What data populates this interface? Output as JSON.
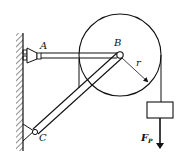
{
  "diagram": {
    "type": "statics-frame-with-pulley",
    "labels": {
      "support_a": "A",
      "pin_b": "B",
      "support_c": "C",
      "radius": "r",
      "force_main": "F",
      "force_sub": "P"
    },
    "components": [
      {
        "id": "wall",
        "description": "fixed vertical wall with hatching"
      },
      {
        "id": "bar-ab",
        "description": "horizontal bar from pin A to pin B"
      },
      {
        "id": "bar-cb",
        "description": "inclined bar from pin C to pin B"
      },
      {
        "id": "pulley",
        "description": "pulley of radius r centered at B"
      },
      {
        "id": "rope",
        "description": "rope over pulley hanging load"
      },
      {
        "id": "load",
        "description": "hanging block with downward force F_P"
      }
    ],
    "colors": {
      "stroke": "#111111",
      "background": "#ffffff"
    }
  }
}
